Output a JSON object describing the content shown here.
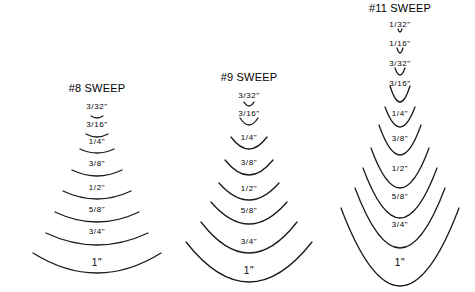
{
  "diagram": {
    "columns": [
      {
        "title": "#8 SWEEP",
        "cx": 97,
        "title_y": 92,
        "items": [
          {
            "label": "3/32\"",
            "ly": 109,
            "half": 6,
            "depth": 2,
            "ay": 116
          },
          {
            "label": "3/16\"",
            "ly": 127,
            "half": 11,
            "depth": 3,
            "ay": 134
          },
          {
            "label": "1/4\"",
            "ly": 144,
            "half": 17,
            "depth": 4,
            "ay": 149
          },
          {
            "label": "3/8\"",
            "ly": 166,
            "half": 25,
            "depth": 6,
            "ay": 170
          },
          {
            "label": "1/2\"",
            "ly": 190,
            "half": 34,
            "depth": 8,
            "ay": 191
          },
          {
            "label": "5/8\"",
            "ly": 212,
            "half": 42,
            "depth": 10,
            "ay": 212
          },
          {
            "label": "3/4\"",
            "ly": 234,
            "half": 51,
            "depth": 12,
            "ay": 233
          },
          {
            "label": "1\"",
            "ly": 266,
            "half": 64,
            "depth": 20,
            "ay": 253
          }
        ]
      },
      {
        "title": "#9 SWEEP",
        "cx": 249,
        "title_y": 81,
        "items": [
          {
            "label": "3/32\"",
            "ly": 98,
            "half": 5,
            "depth": 4,
            "ay": 102
          },
          {
            "label": "3/16\"",
            "ly": 116,
            "half": 9,
            "depth": 7,
            "ay": 118
          },
          {
            "label": "1/4\"",
            "ly": 140,
            "half": 18,
            "depth": 12,
            "ay": 137
          },
          {
            "label": "3/8\"",
            "ly": 165,
            "half": 24,
            "depth": 15,
            "ay": 160
          },
          {
            "label": "1/2\"",
            "ly": 191,
            "half": 30,
            "depth": 17,
            "ay": 183
          },
          {
            "label": "5/8\"",
            "ly": 213,
            "half": 38,
            "depth": 22,
            "ay": 202
          },
          {
            "label": "3/4\"",
            "ly": 244,
            "half": 48,
            "depth": 31,
            "ay": 222
          },
          {
            "label": "1\"",
            "ly": 274,
            "half": 63,
            "depth": 40,
            "ay": 242
          }
        ]
      },
      {
        "title": "#11 SWEEP",
        "cx": 400,
        "title_y": 12,
        "items": [
          {
            "label": "1/32\"",
            "ly": 27,
            "half": 2,
            "depth": 3,
            "ay": 29
          },
          {
            "label": "1/16\"",
            "ly": 46,
            "half": 3,
            "depth": 5,
            "ay": 48
          },
          {
            "label": "3/32\"",
            "ly": 66,
            "half": 5,
            "depth": 7,
            "ay": 68
          },
          {
            "label": "3/16\"",
            "ly": 86,
            "half": 10,
            "depth": 16,
            "ay": 86
          },
          {
            "label": "1/4\"",
            "ly": 116,
            "half": 15,
            "depth": 20,
            "ay": 107
          },
          {
            "label": "3/8\"",
            "ly": 141,
            "half": 21,
            "depth": 30,
            "ay": 125
          },
          {
            "label": "1/2\"",
            "ly": 171,
            "half": 29,
            "depth": 40,
            "ay": 148
          },
          {
            "label": "5/8\"",
            "ly": 199,
            "half": 37,
            "depth": 50,
            "ay": 168
          },
          {
            "label": "3/4\"",
            "ly": 227,
            "half": 45,
            "depth": 60,
            "ay": 188
          },
          {
            "label": "1\"",
            "ly": 266,
            "half": 59,
            "depth": 78,
            "ay": 208
          }
        ]
      }
    ]
  }
}
